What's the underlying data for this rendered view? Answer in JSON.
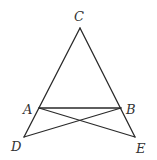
{
  "diagram": {
    "type": "geometry",
    "points": {
      "C": {
        "label": "C",
        "x": 80,
        "y": 28,
        "label_x": 74,
        "label_y": 21
      },
      "A": {
        "label": "A",
        "x": 39,
        "y": 108,
        "label_x": 23,
        "label_y": 114
      },
      "B": {
        "label": "B",
        "x": 121,
        "y": 108,
        "label_x": 126,
        "label_y": 114
      },
      "D": {
        "label": "D",
        "x": 24,
        "y": 137,
        "label_x": 11,
        "label_y": 151
      },
      "E": {
        "label": "E",
        "x": 135,
        "y": 137,
        "label_x": 136,
        "label_y": 153
      }
    },
    "segments": [
      {
        "name": "CD",
        "from": "C",
        "to": "D"
      },
      {
        "name": "CE",
        "from": "C",
        "to": "E"
      },
      {
        "name": "AB",
        "from": "A",
        "to": "B"
      },
      {
        "name": "AE",
        "from": "A",
        "to": "E"
      },
      {
        "name": "BD",
        "from": "B",
        "to": "D"
      }
    ],
    "line_color": "#2a2a2a",
    "label_color": "#333333"
  }
}
